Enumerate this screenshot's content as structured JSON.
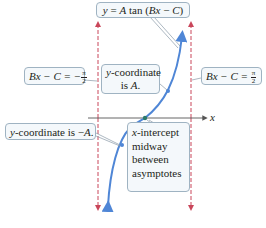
{
  "diagram": {
    "title_label": {
      "lhs": "y",
      "eq": " = ",
      "amp": "A",
      "func": " tan (",
      "arg_b": "Bx",
      "minus": " − ",
      "arg_c": "C",
      "close": ")"
    },
    "left_asymptote_label": {
      "lhs": "Bx − C = −",
      "num": "π",
      "den": "2"
    },
    "right_asymptote_label": {
      "lhs": "Bx − C = ",
      "num": "π",
      "den": "2"
    },
    "point_positive_label": {
      "line1_var": "y",
      "line1_rest": "-coordinate",
      "line2_pre": "is ",
      "line2_var": "A",
      "line2_post": "."
    },
    "point_negative_label": {
      "var": "y",
      "rest": "-coordinate is −",
      "amp": "A",
      "post": "."
    },
    "intercept_label": {
      "line1_var": "x",
      "line1_rest": "-intercept",
      "line2": "midway",
      "line3": "between",
      "line4": "asymptotes"
    },
    "x_axis_label": "x",
    "colors": {
      "curve": "#4f86d6",
      "asymptote": "#c9465a",
      "axis": "#555555",
      "intercept_point": "#2b7a6b",
      "label_bg": "#f4f8fb",
      "label_border": "#9fb3c2"
    }
  }
}
